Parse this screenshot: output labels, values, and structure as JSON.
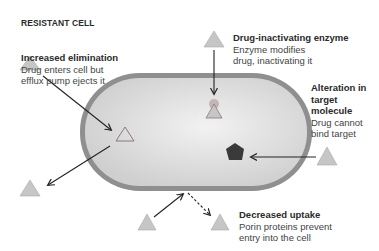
{
  "heading": "RESISTANT CELL",
  "mechanisms": [
    {
      "id": "increased-elimination",
      "title": "Increased elimination",
      "desc_lines": [
        "Drug enters cell but",
        "efflux pump ejects it"
      ]
    },
    {
      "id": "drug-inactivating-enzyme",
      "title": "Drug-inactivating enzyme",
      "desc_lines": [
        "Enzyme modifies",
        "drug, inactivating it"
      ]
    },
    {
      "id": "alteration-in-target",
      "title_lines": [
        "Alteration in",
        "target",
        "molecule"
      ],
      "desc_lines": [
        "Drug cannot",
        "bind target"
      ]
    },
    {
      "id": "decreased-uptake",
      "title": "Decreased uptake",
      "desc_lines": [
        "Porin proteins prevent",
        "entry into the cell"
      ]
    }
  ],
  "colors": {
    "cell_wall": "#8c8c8c",
    "cell_fill": "#d9d9d9",
    "drug_triangle": "#c4c4c4",
    "drug_outline": "#a0a0a0",
    "target_pentagon": "#3a3a3a",
    "arrow": "#222222"
  }
}
